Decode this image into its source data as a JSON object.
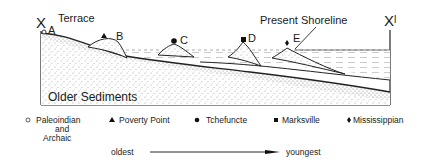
{
  "diagram": {
    "section_start": "X",
    "section_end": "Xˡ",
    "terrace_label": "Terrace",
    "shoreline_label": "Present Shoreline",
    "older_sediments_label": "Older Sediments",
    "sites": [
      {
        "id": "A",
        "period": "Paleoindian and Archaic",
        "symbol": "open-circle"
      },
      {
        "id": "B",
        "period": "Poverty Point",
        "symbol": "triangle"
      },
      {
        "id": "C",
        "period": "Tchefuncte",
        "symbol": "filled-circle"
      },
      {
        "id": "D",
        "period": "Marksville",
        "symbol": "square"
      },
      {
        "id": "E",
        "period": "Mississippian",
        "symbol": "diamond"
      }
    ]
  },
  "legend": {
    "items": [
      {
        "symbol": "○",
        "line1": "Paleoindian",
        "line2": "and",
        "line3": "Archaic"
      },
      {
        "symbol": "▲",
        "line1": "Poverty Point"
      },
      {
        "symbol": "●",
        "line1": "Tchefuncte"
      },
      {
        "symbol": "■",
        "line1": "Marksville"
      },
      {
        "symbol": "♦",
        "line1": "Mississippian"
      }
    ],
    "timeline": {
      "start": "oldest",
      "end": "youngest"
    }
  }
}
